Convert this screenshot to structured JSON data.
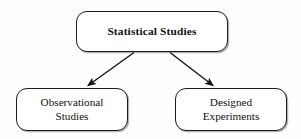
{
  "diagram": {
    "type": "tree",
    "title_node": {
      "id": "statistical-studies",
      "label": "Statistical Studies",
      "bold": true
    },
    "children": [
      {
        "id": "observational-studies",
        "label": "Observational\nStudies",
        "bold": false
      },
      {
        "id": "designed-experiments",
        "label": "Designed\nExperiments",
        "bold": false
      }
    ],
    "edges": [
      {
        "id": "edge-root-to-observational",
        "from": "statistical-studies",
        "to": "observational-studies",
        "arrowhead": "filled-triangle"
      },
      {
        "id": "edge-root-to-designed",
        "from": "statistical-studies",
        "to": "designed-experiments",
        "arrowhead": "filled-triangle"
      }
    ],
    "colors": {
      "background": "#fefefe",
      "node_fill": "#ffffff",
      "node_stroke": "#1c1c1c",
      "edge_stroke": "#161616",
      "text": "#111111"
    }
  }
}
